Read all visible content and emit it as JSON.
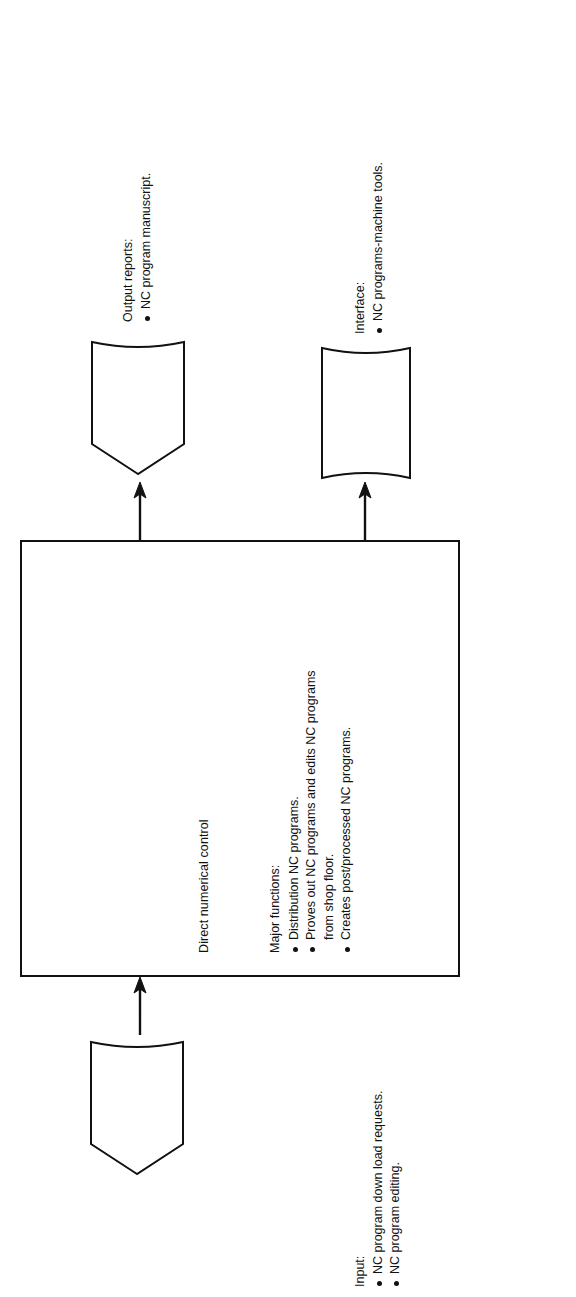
{
  "diagram": {
    "orientation": "rotated-90-ccw",
    "ink_color": "#111111",
    "background_color": "#ffffff",
    "process": {
      "title": "Direct numerical control",
      "functions_header": "Major functions:",
      "functions": [
        {
          "text": "Distribution NC programs.",
          "bulleted": true
        },
        {
          "text": "Proves out NC programs and edits NC programs",
          "bulleted": true
        },
        {
          "text": "from shop floor.",
          "bulleted": false
        },
        {
          "text": "Creates post/processed NC programs.",
          "bulleted": true
        }
      ]
    },
    "input": {
      "header": "Input:",
      "items": [
        {
          "text": "NC program down load requests.",
          "bulleted": true
        },
        {
          "text": "NC program editing.",
          "bulleted": true
        }
      ],
      "shape": "document-symbol"
    },
    "output_reports": {
      "header": "Output reports:",
      "items": [
        {
          "text": "NC program manuscript.",
          "bulleted": true
        }
      ],
      "shape": "document-symbol"
    },
    "interface": {
      "header": "Interface:",
      "items": [
        {
          "text": "NC programs-machine tools.",
          "bulleted": true
        }
      ],
      "shape": "curved-edge-box"
    },
    "connectors": [
      {
        "name": "input-to-process",
        "direction": "into-process"
      },
      {
        "name": "process-to-output-reports",
        "direction": "out-of-process"
      },
      {
        "name": "process-to-interface",
        "direction": "out-of-process"
      }
    ]
  }
}
